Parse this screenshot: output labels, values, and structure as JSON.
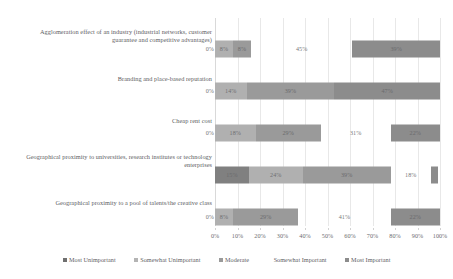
{
  "chart_data": {
    "type": "bar",
    "orientation": "horizontal",
    "stacked": true,
    "stack_mode": "percent",
    "title": "",
    "subtitle": "",
    "xlabel": "",
    "ylabel": "",
    "xlim": [
      0,
      100
    ],
    "xtick_labels": [
      "0%",
      "10%",
      "20%",
      "30%",
      "40%",
      "50%",
      "60%",
      "70%",
      "80%",
      "90%",
      "100%"
    ],
    "xtick_values": [
      0,
      10,
      20,
      30,
      40,
      50,
      60,
      70,
      80,
      90,
      100
    ],
    "grid": true,
    "grid_axis": "x",
    "legend_position": "bottom",
    "categories": [
      "Agglomeration effect of an industry (industrial networks, customer guarantee and competitive advantages)",
      "Branding and place-based reputation",
      "Cheap rent cost",
      "Geographical proximity to universities, research institutes or technology enterprises",
      "Geographical proximity to a pool of talents/the creative class"
    ],
    "series": [
      {
        "name": "Most Unimportant",
        "color": "#808080",
        "values": [
          0,
          0,
          0,
          15,
          0
        ],
        "labels": [
          "0%",
          "0%",
          "0%",
          "15%",
          "0%"
        ]
      },
      {
        "name": "Somewhat Unimportant",
        "color": "#b0b0b0",
        "values": [
          8,
          14,
          18,
          24,
          8
        ],
        "labels": [
          "8%",
          "14%",
          "18%",
          "24%",
          "8%"
        ]
      },
      {
        "name": "Moderate",
        "color": "#9a9a9a",
        "values": [
          8,
          39,
          29,
          39,
          29
        ],
        "labels": [
          "8%",
          "39%",
          "29%",
          "39%",
          "29%"
        ]
      },
      {
        "name": "Somewhat Important",
        "color": "#ffffff",
        "values": [
          45,
          0,
          31,
          18,
          41
        ],
        "labels": [
          "45%",
          "",
          "31%",
          "18%",
          "41%"
        ]
      },
      {
        "name": "Most Important",
        "color": "#8c8c8c",
        "values": [
          39,
          47,
          22,
          3,
          22
        ],
        "labels": [
          "39%",
          "47%",
          "22%",
          "",
          "22%"
        ]
      }
    ]
  },
  "legend": {
    "items": [
      {
        "label": "Most Unimportant",
        "color": "#6f6f6f"
      },
      {
        "label": "Somewhat Unimportant",
        "color": "#b4b4b4"
      },
      {
        "label": "Moderate",
        "color": "#9a9a9a"
      },
      {
        "label": "Somewhat Important",
        "color": "#ffffff"
      },
      {
        "label": "Most Important",
        "color": "#8c8c8c"
      }
    ]
  }
}
